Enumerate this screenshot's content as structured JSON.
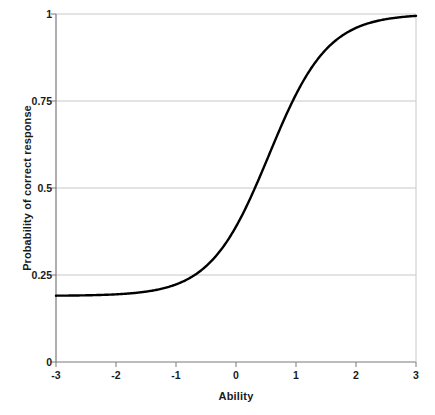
{
  "chart_data": {
    "type": "line",
    "title": "",
    "subtitle": "",
    "xlabel": "Ability",
    "ylabel": "Probability of correct response",
    "xlim": [
      -3,
      3
    ],
    "ylim": [
      0,
      1
    ],
    "xticks": [
      "-3",
      "-2",
      "-1",
      "0",
      "1",
      "2",
      "3"
    ],
    "xtick_values": [
      -3,
      -2,
      -1,
      0,
      1,
      2,
      3
    ],
    "yticks": [
      "0",
      "0.25",
      "0.5",
      "0.75",
      "1"
    ],
    "ytick_values": [
      0,
      0.25,
      0.5,
      0.75,
      1
    ],
    "grid": "horizontal",
    "legend": "none",
    "line_color": "#000000",
    "grid_color": "#c8c8c8",
    "axis_color": "#808080",
    "background_color": "#ffffff",
    "model": {
      "name": "3PL item characteristic curve",
      "discrimination_a": 1.2,
      "difficulty_b": 0.55,
      "guessing_c": 0.19
    },
    "series": [
      {
        "name": "Item characteristic curve",
        "x": [
          -3,
          -2.75,
          -2.5,
          -2.25,
          -2,
          -1.75,
          -1.5,
          -1.25,
          -1,
          -0.75,
          -0.5,
          -0.25,
          0,
          0.25,
          0.5,
          0.75,
          1,
          1.25,
          1.5,
          1.75,
          2,
          2.25,
          2.5,
          2.75,
          3
        ],
        "values": [
          0.191,
          0.192,
          0.194,
          0.196,
          0.2,
          0.205,
          0.212,
          0.223,
          0.238,
          0.26,
          0.29,
          0.331,
          0.383,
          0.447,
          0.52,
          0.597,
          0.672,
          0.74,
          0.798,
          0.845,
          0.881,
          0.909,
          0.931,
          0.947,
          0.959
        ]
      }
    ]
  },
  "axes": {
    "x_tick_labels": [
      "-3",
      "-2",
      "-1",
      "0",
      "1",
      "2",
      "3"
    ],
    "y_tick_labels": [
      "1",
      "0.75",
      "0.5",
      "0.25",
      "0"
    ],
    "x_axis_title": "Ability",
    "y_axis_title": "Probability of correct response"
  }
}
